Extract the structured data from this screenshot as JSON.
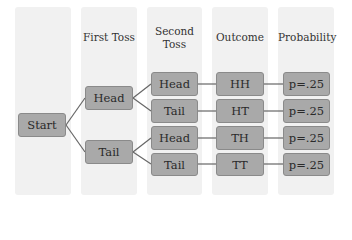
{
  "columns": [
    {
      "header": ""
    },
    {
      "header": "First Toss"
    },
    {
      "header_line1": "Second",
      "header_line2": "Toss"
    },
    {
      "header": "Outcome"
    },
    {
      "header": "Probability"
    }
  ],
  "nodes": {
    "start": "Start",
    "first_toss": [
      "Head",
      "Tail"
    ],
    "second_toss": [
      "Head",
      "Tail",
      "Head",
      "Tail"
    ],
    "outcomes": [
      "HH",
      "HT",
      "TH",
      "TT"
    ],
    "probabilities": [
      "p=.25",
      "p=.25",
      "p=.25",
      "p=.25"
    ]
  },
  "colors": {
    "column_bg": "#f1f1f1",
    "box_fill": "#a9a9a9",
    "box_border": "#8a8a8a",
    "line": "#666666"
  }
}
